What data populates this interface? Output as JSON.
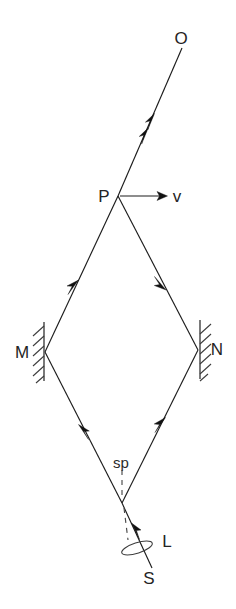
{
  "figure": {
    "background_color": "#ffffff",
    "line_color": "#1c1c1c",
    "width": 236,
    "height": 609
  },
  "labels": {
    "observer": "O",
    "beam_splitter_point": "P",
    "velocity_vector": "v",
    "mirror_left": "M",
    "mirror_right": "N",
    "splitter_plate": "sp",
    "lens": "L",
    "source": "S"
  },
  "nodes": [
    {
      "name": "O",
      "label": "O",
      "x": 182,
      "y": 48
    },
    {
      "name": "P",
      "label": "P",
      "x": 118,
      "y": 196
    },
    {
      "name": "M",
      "label": "M",
      "x": 45,
      "y": 352
    },
    {
      "name": "N",
      "label": "N",
      "x": 198,
      "y": 350
    },
    {
      "name": "sp",
      "label": "sp",
      "x": 122,
      "y": 503
    },
    {
      "name": "S",
      "label": "S",
      "x": 152,
      "y": 568
    }
  ],
  "segments": [
    {
      "name": "P-to-O",
      "from": "P",
      "to": "O",
      "arrows": 2,
      "direction": "toward-O"
    },
    {
      "name": "M-to-P",
      "from": "M",
      "to": "P",
      "arrows": 1,
      "direction": "toward-P"
    },
    {
      "name": "P-to-N",
      "from": "P",
      "to": "N",
      "arrows": 1,
      "direction": "toward-N"
    },
    {
      "name": "sp-to-M",
      "from": "sp",
      "to": "M",
      "arrows": 1,
      "direction": "toward-M"
    },
    {
      "name": "sp-to-N",
      "from": "sp",
      "to": "N",
      "arrows": 1,
      "direction": "toward-N"
    },
    {
      "name": "S-to-sp",
      "from": "S",
      "to": "sp",
      "arrows": 1,
      "direction": "toward-sp"
    },
    {
      "name": "velocity-arrow",
      "from": "P",
      "to": "v",
      "arrows": 1,
      "direction": "right"
    }
  ],
  "mirrors": [
    {
      "name": "mirror-M",
      "label": "M",
      "orientation": "vertical",
      "hatching": "left"
    },
    {
      "name": "mirror-N",
      "label": "N",
      "orientation": "vertical",
      "hatching": "right"
    }
  ]
}
